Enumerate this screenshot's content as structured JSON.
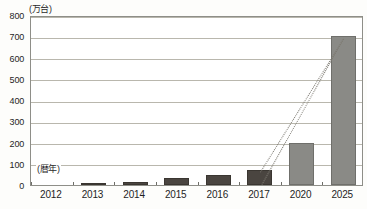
{
  "chart_data": {
    "type": "bar",
    "title": "",
    "subtitle": "",
    "xlabel": "(暦年)",
    "ylabel": "(万台)",
    "unit_note": "(万台)",
    "xaxis_note": "(暦年)",
    "categories": [
      "2012",
      "2013",
      "2014",
      "2015",
      "2016",
      "2017",
      "2020",
      "2025"
    ],
    "values": [
      0,
      2,
      12,
      34,
      48,
      72,
      200,
      700
    ],
    "ylim": [
      0,
      800
    ],
    "ytick_values": [
      0,
      100,
      200,
      300,
      400,
      500,
      600,
      700,
      800
    ],
    "ytick_labels": [
      "0",
      "100",
      "200",
      "300",
      "400",
      "500",
      "600",
      "700",
      "800"
    ],
    "grid": true,
    "legend": false,
    "series": [
      {
        "name": "実績・見通し",
        "values": [
          0,
          2,
          12,
          34,
          48,
          72,
          200,
          700
        ],
        "point_styles": [
          "actual",
          "actual",
          "actual",
          "actual",
          "actual",
          "actual",
          "forecast",
          "forecast"
        ]
      }
    ],
    "colors": {
      "actual_bar": "#4a4540",
      "forecast_bar": "#8a8a86",
      "gridline": "#b9b7ad",
      "frame": "#8e8e88",
      "trend_line": "#7d7a72",
      "background": "#ffffff",
      "text": "#1f1f1f"
    },
    "annotations": [
      {
        "type": "dotted-trend-line",
        "name": "trend-line-upper",
        "from_category": "2017",
        "to_category": "2025",
        "from_value": 72,
        "to_value": 700
      },
      {
        "type": "dotted-trend-line",
        "name": "trend-line-lower",
        "from_category": "2017",
        "to_category": "2025",
        "from_value": 0,
        "to_value": 700
      }
    ]
  }
}
